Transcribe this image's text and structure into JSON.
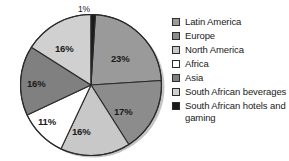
{
  "chart_data": {
    "type": "pie",
    "title": "",
    "categories": [
      "Latin America",
      "Europe",
      "North America",
      "Africa",
      "Asia",
      "South African beverages",
      "South African hotels and gaming"
    ],
    "values": [
      23,
      17,
      16,
      11,
      16,
      16,
      1
    ],
    "value_labels": [
      "23%",
      "17%",
      "16%",
      "11%",
      "16%",
      "16%",
      "1%"
    ],
    "colors": [
      "#9a9a9a",
      "#8c8c8c",
      "#c8c8c8",
      "#ffffff",
      "#808080",
      "#d0d0d0",
      "#1a1a1a"
    ],
    "unit": "%",
    "legend_position": "right",
    "grid": false,
    "start_angle_deg": 3.6,
    "direction": "clockwise"
  },
  "legend": {
    "items": [
      {
        "label": "Latin America",
        "color": "#9a9a9a"
      },
      {
        "label": "Europe",
        "color": "#8c8c8c"
      },
      {
        "label": "North America",
        "color": "#c8c8c8"
      },
      {
        "label": "Africa",
        "color": "#ffffff"
      },
      {
        "label": "Asia",
        "color": "#808080"
      },
      {
        "label": "South African beverages",
        "color": "#d0d0d0"
      },
      {
        "label": "South African hotels and gaming",
        "color": "#1a1a1a"
      }
    ]
  },
  "labels": {
    "latin_america": "23%",
    "europe": "17%",
    "north_america": "16%",
    "africa": "11%",
    "asia": "16%",
    "sa_beverages": "16%",
    "sa_hotels": "1%"
  }
}
